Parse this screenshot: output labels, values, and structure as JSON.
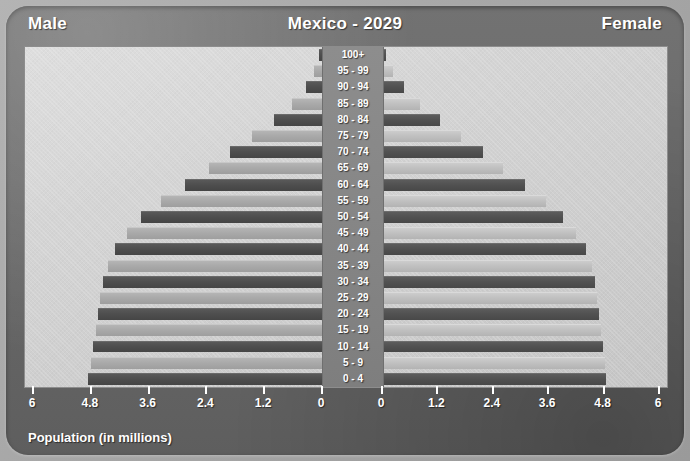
{
  "header": {
    "left_label": "Male",
    "title": "Mexico - 2029",
    "right_label": "Female"
  },
  "footer": {
    "axis_caption": "Population (in millions)"
  },
  "chart_data": {
    "type": "bar",
    "subtype": "population-pyramid",
    "title": "Mexico - 2029",
    "xlabel": "Population (in millions)",
    "ylabel": "",
    "grid": false,
    "legend_position": "header",
    "axis_ticks_left": [
      "6",
      "4.8",
      "3.6",
      "2.4",
      "1.2",
      "0"
    ],
    "axis_ticks_right": [
      "0",
      "1.2",
      "2.4",
      "3.6",
      "4.8",
      "6"
    ],
    "xlim": [
      0,
      6
    ],
    "tick_values": [
      6,
      4.8,
      3.6,
      2.4,
      1.2,
      0
    ],
    "categories": [
      "100+",
      "95 - 99",
      "90 - 94",
      "85 - 89",
      "80 - 84",
      "75 - 79",
      "70 - 74",
      "65 - 69",
      "60 - 64",
      "55 - 59",
      "50 - 54",
      "45 - 49",
      "40 - 44",
      "35 - 39",
      "30 - 34",
      "25 - 29",
      "20 - 24",
      "15 - 19",
      "10 - 14",
      "5 - 9",
      "0 - 4"
    ],
    "series": [
      {
        "name": "Male",
        "side": "left",
        "color": "#4e4e4e",
        "values": [
          0.06,
          0.16,
          0.33,
          0.62,
          1.0,
          1.45,
          1.9,
          2.35,
          2.85,
          3.35,
          3.75,
          4.05,
          4.3,
          4.45,
          4.55,
          4.6,
          4.65,
          4.7,
          4.75,
          4.8,
          4.85
        ]
      },
      {
        "name": "Female",
        "side": "right",
        "color": "#c0c0c0",
        "values": [
          0.09,
          0.24,
          0.47,
          0.82,
          1.25,
          1.72,
          2.18,
          2.62,
          3.1,
          3.55,
          3.92,
          4.2,
          4.42,
          4.55,
          4.62,
          4.66,
          4.7,
          4.74,
          4.78,
          4.82,
          4.85
        ]
      }
    ]
  },
  "colors": {
    "frame": "#6a6a6a",
    "panel": "#d4d4d4",
    "center_column": "#868686",
    "bar_dark": "#4e4e4e",
    "bar_light": "#a9a9a9",
    "text": "#ffffff"
  }
}
